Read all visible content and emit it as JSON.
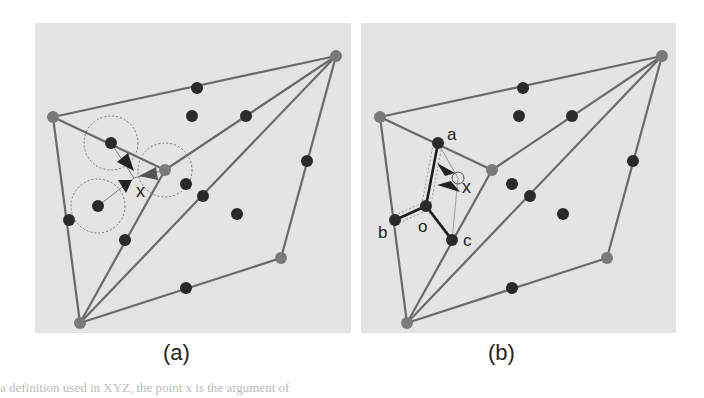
{
  "colors": {
    "panel_bg": "#e4e4e4",
    "edge": "#6a6a6a",
    "vertex": "#7a7a7a",
    "dot": "#2a2a2a",
    "circle": "#777777"
  },
  "panels": [
    {
      "id": "a",
      "caption": "(a)",
      "caption_x": 177,
      "box": {
        "x": 35,
        "y": 23,
        "w": 316,
        "h": 310
      },
      "vertices": [
        [
          336,
          56
        ],
        [
          53,
          117
        ],
        [
          80,
          323
        ],
        [
          281,
          258
        ],
        [
          165,
          170
        ]
      ],
      "edges": [
        [
          0,
          1
        ],
        [
          1,
          2
        ],
        [
          2,
          3
        ],
        [
          3,
          0
        ],
        [
          1,
          4
        ],
        [
          4,
          0
        ],
        [
          4,
          2
        ],
        [
          2,
          0
        ]
      ],
      "dots": [
        [
          197,
          88
        ],
        [
          192,
          116
        ],
        [
          246,
          116
        ],
        [
          111,
          143
        ],
        [
          307,
          161
        ],
        [
          186,
          184
        ],
        [
          203,
          196
        ],
        [
          98,
          206
        ],
        [
          237,
          214
        ],
        [
          69,
          220
        ],
        [
          125,
          240
        ],
        [
          186,
          288
        ]
      ],
      "circles": [
        {
          "cx": 111,
          "cy": 143,
          "r": 27
        },
        {
          "cx": 165,
          "cy": 170,
          "r": 27
        },
        {
          "cx": 98,
          "cy": 206,
          "r": 27
        }
      ],
      "arrows": [
        {
          "from": [
            111,
            143
          ],
          "to": [
            134,
            171
          ],
          "tip": [
            134,
            171
          ],
          "base": [
            [
              117,
              162
            ],
            [
              128,
              153
            ]
          ]
        },
        {
          "from": [
            98,
            206
          ],
          "to": [
            132,
            180
          ],
          "tip": [
            132,
            180
          ],
          "base": [
            [
              118,
              180
            ],
            [
              126,
              193
            ]
          ]
        },
        {
          "from": [
            165,
            170
          ],
          "to": [
            139,
            176
          ],
          "tip": [
            139,
            176
          ],
          "base": [
            [
              156,
              167
            ],
            [
              158,
              180
            ]
          ]
        }
      ],
      "x_label": {
        "text": "x",
        "x": 136,
        "y": 197
      }
    },
    {
      "id": "b",
      "caption": "(b)",
      "caption_x": 502,
      "box": {
        "x": 361,
        "y": 23,
        "w": 315,
        "h": 310
      },
      "vertices": [
        [
          662,
          56
        ],
        [
          380,
          117
        ],
        [
          407,
          323
        ],
        [
          607,
          258
        ],
        [
          492,
          170
        ]
      ],
      "edges": [
        [
          0,
          1
        ],
        [
          1,
          2
        ],
        [
          2,
          3
        ],
        [
          3,
          0
        ],
        [
          1,
          4
        ],
        [
          4,
          0
        ],
        [
          4,
          2
        ],
        [
          2,
          0
        ]
      ],
      "dots": [
        [
          523,
          88
        ],
        [
          519,
          116
        ],
        [
          572,
          116
        ],
        [
          633,
          161
        ],
        [
          512,
          184
        ],
        [
          530,
          196
        ],
        [
          563,
          214
        ],
        [
          512,
          288
        ]
      ],
      "labeled_dots": [
        {
          "name": "a",
          "x": 438,
          "y": 143,
          "lx": 447,
          "ly": 140
        },
        {
          "name": "o",
          "x": 426,
          "y": 206,
          "lx": 418,
          "ly": 232
        },
        {
          "name": "b",
          "x": 395,
          "y": 220,
          "lx": 378,
          "ly": 238
        },
        {
          "name": "c",
          "x": 452,
          "y": 240,
          "lx": 463,
          "ly": 246
        }
      ],
      "star_edges": [
        [
          "a",
          "o"
        ],
        [
          "o",
          "b"
        ],
        [
          "o",
          "c"
        ]
      ],
      "arrows": [
        {
          "tip": [
            455,
            173
          ],
          "base": [
            [
              437,
              163
            ],
            [
              445,
              176
            ]
          ]
        },
        {
          "tip": [
            460,
            192
          ],
          "base": [
            [
              437,
              185
            ],
            [
              451,
              181
            ]
          ]
        }
      ],
      "small_circle": {
        "cx": 458,
        "cy": 178,
        "r": 6
      },
      "x_label": {
        "text": "x",
        "x": 462,
        "y": 193
      }
    }
  ],
  "footer": "a definition used in XYZ, the point x is the argument of"
}
